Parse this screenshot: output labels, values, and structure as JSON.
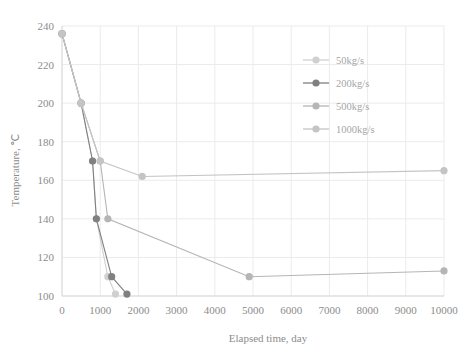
{
  "chart_data": {
    "type": "line",
    "title": "",
    "xlabel": "Elapsed time, day",
    "ylabel": "Temperature, ℃",
    "xlim": [
      0,
      10000
    ],
    "ylim": [
      100,
      240
    ],
    "xticks": [
      "0",
      "1000",
      "2000",
      "3000",
      "4000",
      "5000",
      "6000",
      "7000",
      "8000",
      "9000",
      "10000"
    ],
    "yticks": [
      "100",
      "120",
      "140",
      "160",
      "180",
      "200",
      "220",
      "240"
    ],
    "grid": true,
    "legend_position": "right-top",
    "series": [
      {
        "name": "50kg/s",
        "color": "#d0d0d0",
        "x": [
          0,
          500,
          800,
          900,
          1200,
          1400
        ],
        "y": [
          236,
          200,
          170,
          140,
          110,
          101
        ]
      },
      {
        "name": "200kg/s",
        "color": "#808080",
        "x": [
          0,
          500,
          800,
          900,
          1300,
          1700
        ],
        "y": [
          236,
          200,
          170,
          140,
          110,
          101
        ]
      },
      {
        "name": "500kg/s",
        "color": "#b5b5b5",
        "x": [
          0,
          500,
          1000,
          1200,
          4900,
          10000
        ],
        "y": [
          236,
          200,
          170,
          140,
          110,
          113
        ]
      },
      {
        "name": "1000kg/s",
        "color": "#c4c4c4",
        "x": [
          0,
          500,
          1000,
          2100,
          10000
        ],
        "y": [
          236,
          200,
          170,
          162,
          165
        ]
      }
    ]
  },
  "axes": {
    "x_title": "Elapsed time, day",
    "y_title": "Temperature, ℃"
  },
  "legend": {
    "items": [
      {
        "label": "50kg/s",
        "color": "#d0d0d0"
      },
      {
        "label": "200kg/s",
        "color": "#808080"
      },
      {
        "label": "500kg/s",
        "color": "#b5b5b5"
      },
      {
        "label": "1000kg/s",
        "color": "#c4c4c4"
      }
    ]
  },
  "colors": {
    "grid": "#ebebeb",
    "axis": "#d9d9d9",
    "text": "#8c8c8c",
    "background": "#ffffff"
  }
}
